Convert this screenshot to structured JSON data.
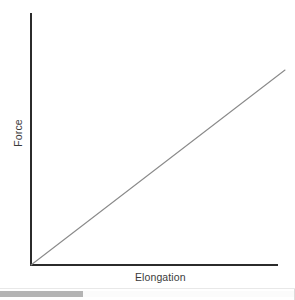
{
  "chart_data": {
    "type": "line",
    "title": "",
    "xlabel": "Elongation",
    "ylabel": "Force",
    "grid": false,
    "legend": null,
    "xlim": [
      0,
      1
    ],
    "ylim": [
      0,
      1
    ],
    "axis_ticks": {
      "x": [],
      "y": []
    },
    "series": [
      {
        "name": "Force vs Elongation",
        "color": "#8a8a8a",
        "x": [
          0,
          1
        ],
        "values": [
          0,
          0.79
        ],
        "points": [
          [
            0,
            0
          ],
          [
            1,
            0.79
          ]
        ],
        "description": "Straight line rising from the origin with constant positive slope"
      }
    ],
    "annotations": []
  },
  "figure": {
    "background_color": "#ffffff",
    "axis_color": "#2b2b2b",
    "line_color": "#8a8a8a",
    "text_color": "#3a3a3a",
    "xlabel": "Elongation",
    "ylabel": "Force"
  },
  "scrollbar": {
    "orientation": "horizontal",
    "thumb_start_percent": 0,
    "thumb_width_percent": 28,
    "track_color": "#fbfbfb",
    "thumb_color": "#b4b4b4"
  }
}
